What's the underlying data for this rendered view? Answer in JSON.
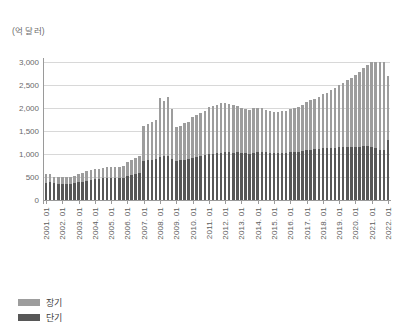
{
  "chart_data": {
    "type": "bar",
    "stacked": true,
    "title": "",
    "subtitle": "",
    "unit_label": "(억 달러)",
    "xlabel": "",
    "ylabel": "",
    "ylim": [
      0,
      3000
    ],
    "yticks": [
      0,
      500,
      1000,
      1500,
      2000,
      2500,
      3000
    ],
    "ytick_labels": [
      "0",
      "500",
      "1,000",
      "1,500",
      "2,000",
      "2,500",
      "3,000"
    ],
    "grid": true,
    "legend_position": "bottom-left",
    "x_tick_labels": [
      "2001. 01",
      "2002. 01",
      "2003. 01",
      "2004. 01",
      "2005. 01",
      "2006. 01",
      "2007. 01",
      "2008. 01",
      "2009. 01",
      "2010. 01",
      "2011. 01",
      "2012. 01",
      "2013. 01",
      "2014. 01",
      "2015. 01",
      "2016. 01",
      "2017. 01",
      "2018. 01",
      "2019. 01",
      "2020. 01",
      "2021. 01",
      "2022. 01"
    ],
    "x_tick_period_index": [
      0,
      4,
      8,
      12,
      16,
      20,
      24,
      28,
      32,
      36,
      40,
      44,
      48,
      52,
      56,
      60,
      64,
      68,
      72,
      76,
      80,
      84
    ],
    "categories": [
      "2001.01",
      "2001.04",
      "2001.07",
      "2001.10",
      "2002.01",
      "2002.04",
      "2002.07",
      "2002.10",
      "2003.01",
      "2003.04",
      "2003.07",
      "2003.10",
      "2004.01",
      "2004.04",
      "2004.07",
      "2004.10",
      "2005.01",
      "2005.04",
      "2005.07",
      "2005.10",
      "2006.01",
      "2006.04",
      "2006.07",
      "2006.10",
      "2007.01",
      "2007.04",
      "2007.07",
      "2007.10",
      "2008.01",
      "2008.04",
      "2008.07",
      "2008.10",
      "2009.01",
      "2009.04",
      "2009.07",
      "2009.10",
      "2010.01",
      "2010.04",
      "2010.07",
      "2010.10",
      "2011.01",
      "2011.04",
      "2011.07",
      "2011.10",
      "2012.01",
      "2012.04",
      "2012.07",
      "2012.10",
      "2013.01",
      "2013.04",
      "2013.07",
      "2013.10",
      "2014.01",
      "2014.04",
      "2014.07",
      "2014.10",
      "2015.01",
      "2015.04",
      "2015.07",
      "2015.10",
      "2016.01",
      "2016.04",
      "2016.07",
      "2016.10",
      "2017.01",
      "2017.04",
      "2017.07",
      "2017.10",
      "2018.01",
      "2018.04",
      "2018.07",
      "2018.10",
      "2019.01",
      "2019.04",
      "2019.07",
      "2019.10",
      "2020.01",
      "2020.04",
      "2020.07",
      "2020.10",
      "2021.01",
      "2021.04",
      "2021.07",
      "2021.10",
      "2022.01"
    ],
    "series": [
      {
        "name": "단기",
        "color": "#575757",
        "values": [
          380,
          390,
          360,
          350,
          340,
          340,
          355,
          370,
          390,
          400,
          420,
          440,
          455,
          460,
          470,
          480,
          470,
          475,
          470,
          480,
          520,
          540,
          560,
          580,
          840,
          860,
          880,
          900,
          930,
          950,
          960,
          900,
          850,
          860,
          880,
          900,
          920,
          940,
          960,
          980,
          1000,
          1010,
          1020,
          1030,
          1040,
          1040,
          1030,
          1035,
          1020,
          1020,
          1010,
          1030,
          1040,
          1050,
          1040,
          1030,
          1020,
          1020,
          1025,
          1030,
          1040,
          1045,
          1050,
          1060,
          1080,
          1090,
          1100,
          1110,
          1120,
          1130,
          1135,
          1140,
          1145,
          1150,
          1150,
          1155,
          1160,
          1160,
          1170,
          1180,
          1190,
          1200,
          1230,
          1260,
          1300
        ]
      },
      {
        "name": "장기",
        "color": "#9d9d9d",
        "values": [
          180,
          175,
          150,
          150,
          150,
          155,
          155,
          160,
          185,
          195,
          210,
          215,
          220,
          225,
          230,
          235,
          250,
          250,
          255,
          255,
          305,
          320,
          350,
          380,
          770,
          790,
          810,
          840,
          1280,
          1200,
          1270,
          1080,
          740,
          760,
          790,
          800,
          880,
          900,
          940,
          960,
          1020,
          1040,
          1050,
          1080,
          1060,
          1050,
          1030,
          1000,
          980,
          960,
          940,
          960,
          960,
          950,
          920,
          900,
          900,
          900,
          905,
          910,
          930,
          950,
          980,
          1000,
          1050,
          1080,
          1100,
          1140,
          1180,
          1200,
          1250,
          1300,
          1350,
          1400,
          1450,
          1500,
          1550,
          1620,
          1700,
          1750,
          1900,
          2000,
          2150,
          2250,
          1400
        ]
      }
    ]
  },
  "legend": [
    {
      "label": "장기",
      "color": "#9d9d9d"
    },
    {
      "label": "단기",
      "color": "#575757"
    }
  ]
}
